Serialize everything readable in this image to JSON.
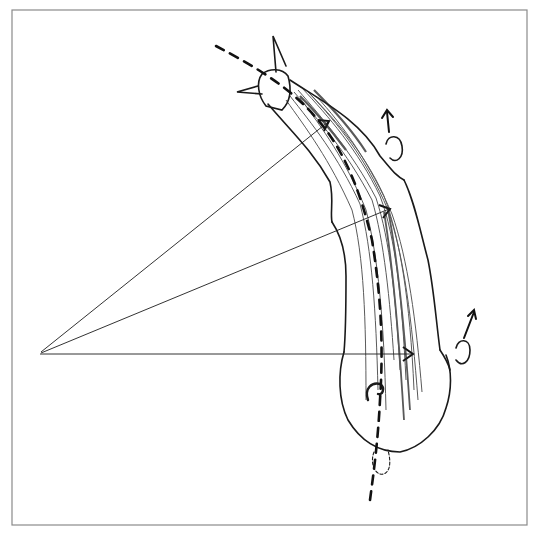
{
  "figure": {
    "frame_color": "#8a8a8a",
    "ink_color": "#1a1a1a",
    "ray_origin": [
      40,
      354
    ],
    "ray_targets": [
      [
        330,
        120
      ],
      [
        392,
        208
      ],
      [
        414,
        354
      ]
    ]
  }
}
